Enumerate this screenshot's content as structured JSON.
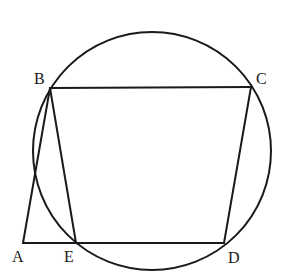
{
  "diagram": {
    "circle": {
      "cx": 152,
      "cy": 151,
      "r": 119
    },
    "points": {
      "A": {
        "label": "A",
        "x": 23,
        "y": 243
      },
      "B": {
        "label": "B",
        "x": 50,
        "y": 88
      },
      "C": {
        "label": "C",
        "x": 251,
        "y": 87
      },
      "D": {
        "label": "D",
        "x": 224,
        "y": 243
      },
      "E": {
        "label": "E",
        "x": 76,
        "y": 243
      }
    },
    "segments": [
      "AB",
      "BC",
      "CD",
      "DE",
      "EA",
      "BE"
    ],
    "labels": {
      "A": "A",
      "B": "B",
      "C": "C",
      "D": "D",
      "E": "E"
    }
  }
}
